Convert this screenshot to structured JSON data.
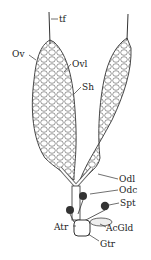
{
  "diagram": {
    "labels": [
      {
        "id": "tf",
        "text": "tf",
        "x": 60,
        "y": 15
      },
      {
        "id": "ov",
        "text": "Ov",
        "x": 12,
        "y": 50
      },
      {
        "id": "ovl",
        "text": "Ovl",
        "x": 72,
        "y": 60
      },
      {
        "id": "sh",
        "text": "Sh",
        "x": 82,
        "y": 83
      },
      {
        "id": "odl",
        "text": "Odl",
        "x": 119,
        "y": 175
      },
      {
        "id": "odc",
        "text": "Odc",
        "x": 119,
        "y": 186
      },
      {
        "id": "spt",
        "text": "Spt",
        "x": 120,
        "y": 199
      },
      {
        "id": "atr",
        "text": "Atr",
        "x": 54,
        "y": 223
      },
      {
        "id": "acgld",
        "text": "AcGld",
        "x": 106,
        "y": 224
      },
      {
        "id": "gtr",
        "text": "Gtr",
        "x": 100,
        "y": 240
      }
    ]
  }
}
